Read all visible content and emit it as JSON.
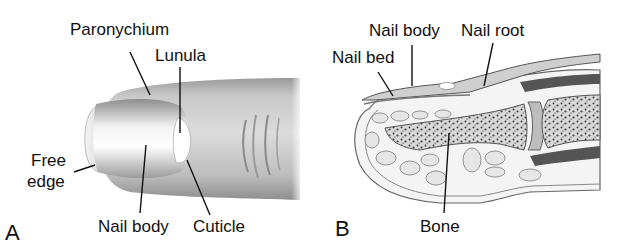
{
  "figure": {
    "panels": [
      {
        "letter": "A",
        "view": "finger-exterior",
        "labels": {
          "paronychium": "Paronychium",
          "lunula": "Lunula",
          "free_edge_line1": "Free",
          "free_edge_line2": "edge",
          "nail_body": "Nail body",
          "cuticle": "Cuticle"
        }
      },
      {
        "letter": "B",
        "view": "finger-cross-section",
        "labels": {
          "nail_body": "Nail body",
          "nail_root": "Nail root",
          "nail_bed": "Nail bed",
          "bone": "Bone"
        }
      }
    ],
    "colors": {
      "background": "#ffffff",
      "text": "#111111",
      "leader_line": "#111111",
      "skin_light": "#e8e8e8",
      "skin_mid": "#b5b5b5",
      "skin_dark": "#8a8a8a",
      "bone_fill": "#d9d9d9",
      "bone_speckle": "#3a3a3a"
    }
  }
}
